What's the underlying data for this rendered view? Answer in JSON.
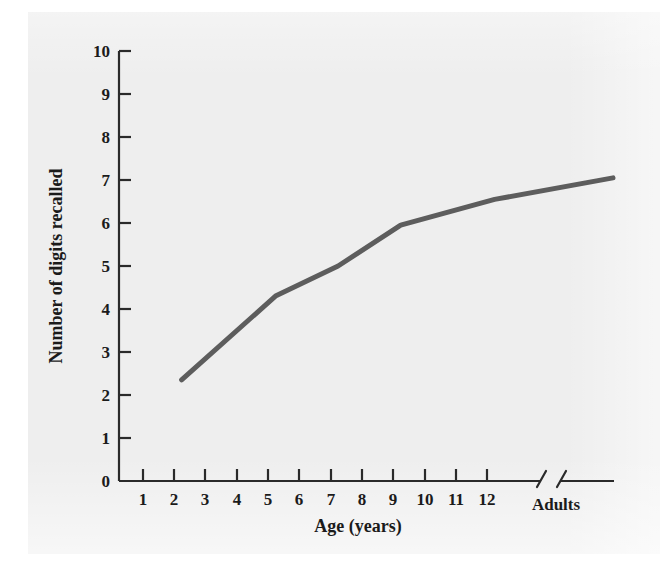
{
  "figure": {
    "background_color": "#eeeeee",
    "page_color": "#ffffff"
  },
  "chart_data": {
    "type": "line",
    "title": "",
    "subtitle": "",
    "xlabel": "Age (years)",
    "ylabel": "Number of digits recalled",
    "grid": false,
    "legend": null,
    "line_color": "#5d5d5d",
    "axis_color": "#2a2a2a",
    "axis_break": {
      "present": true,
      "between": [
        "12",
        "Adults"
      ],
      "style": "double-slash"
    },
    "x": [
      2,
      5,
      7,
      9,
      12,
      "Adults"
    ],
    "y": [
      2.35,
      4.3,
      5.0,
      5.95,
      6.55,
      7.05
    ],
    "series": [
      {
        "name": "Digit span",
        "points": [
          {
            "x": "2",
            "y": 2.35
          },
          {
            "x": "5",
            "y": 4.3
          },
          {
            "x": "7",
            "y": 5.0
          },
          {
            "x": "9",
            "y": 5.95
          },
          {
            "x": "12",
            "y": 6.55
          },
          {
            "x": "Adults",
            "y": 7.05
          }
        ]
      }
    ],
    "xtick_labels": [
      "1",
      "2",
      "3",
      "4",
      "5",
      "6",
      "7",
      "8",
      "9",
      "10",
      "11",
      "12",
      "Adults"
    ],
    "ytick_labels": [
      "0",
      "1",
      "2",
      "3",
      "4",
      "5",
      "6",
      "7",
      "8",
      "9",
      "10"
    ],
    "ylim": [
      0,
      10
    ],
    "ytick_step": 1
  },
  "axes": {
    "y_title": "Number of digits recalled",
    "x_title": "Age (years)",
    "y_ticks": [
      {
        "label": "10",
        "value": 10
      },
      {
        "label": "9",
        "value": 9
      },
      {
        "label": "8",
        "value": 8
      },
      {
        "label": "7",
        "value": 7
      },
      {
        "label": "6",
        "value": 6
      },
      {
        "label": "5",
        "value": 5
      },
      {
        "label": "4",
        "value": 4
      },
      {
        "label": "3",
        "value": 3
      },
      {
        "label": "2",
        "value": 2
      },
      {
        "label": "1",
        "value": 1
      },
      {
        "label": "0",
        "value": 0
      }
    ],
    "x_ticks": [
      {
        "label": "1"
      },
      {
        "label": "2"
      },
      {
        "label": "3"
      },
      {
        "label": "4"
      },
      {
        "label": "5"
      },
      {
        "label": "6"
      },
      {
        "label": "7"
      },
      {
        "label": "8"
      },
      {
        "label": "9"
      },
      {
        "label": "10"
      },
      {
        "label": "11"
      },
      {
        "label": "12"
      }
    ],
    "x_category": {
      "label": "Adults"
    }
  }
}
